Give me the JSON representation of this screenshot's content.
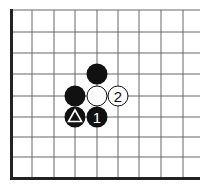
{
  "board": {
    "description": "Go board corner (lower-left) diagram",
    "columns": 9,
    "rows": 9,
    "edges": [
      "left",
      "bottom"
    ]
  },
  "stones": [
    {
      "color": "black",
      "col": 4,
      "row": 3,
      "label": "",
      "marker": ""
    },
    {
      "color": "black",
      "col": 3,
      "row": 4,
      "label": "",
      "marker": ""
    },
    {
      "color": "white",
      "col": 4,
      "row": 4,
      "label": "",
      "marker": ""
    },
    {
      "color": "white",
      "col": 5,
      "row": 4,
      "label": "2",
      "marker": ""
    },
    {
      "color": "black",
      "col": 3,
      "row": 5,
      "label": "",
      "marker": "triangle"
    },
    {
      "color": "black",
      "col": 4,
      "row": 5,
      "label": "1",
      "marker": ""
    }
  ],
  "colors": {
    "black": "#111111",
    "white": "#ffffff",
    "grid": "#555555",
    "edge": "#222222"
  }
}
